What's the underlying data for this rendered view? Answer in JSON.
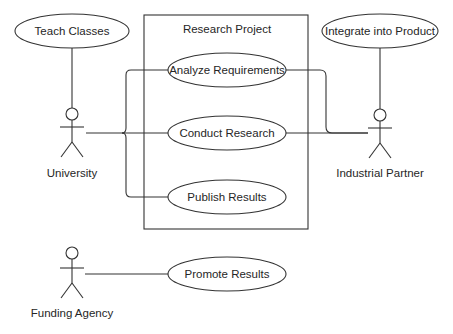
{
  "diagram": {
    "type": "uml-use-case",
    "system": {
      "title": "Research Project"
    },
    "actors": [
      {
        "id": "university",
        "label": "University"
      },
      {
        "id": "industrial_partner",
        "label": "Industrial Partner"
      },
      {
        "id": "funding_agency",
        "label": "Funding Agency"
      }
    ],
    "use_cases": {
      "teach_classes": "Teach Classes",
      "integrate_into_product": "Integrate into Product",
      "analyze_requirements": "Analyze Requirements",
      "conduct_research": "Conduct Research",
      "publish_results": "Publish Results",
      "promote_results": "Promote Results"
    },
    "associations": [
      {
        "actor": "University",
        "use_case": "Teach Classes"
      },
      {
        "actor": "University",
        "use_case": "Analyze Requirements"
      },
      {
        "actor": "University",
        "use_case": "Conduct Research"
      },
      {
        "actor": "University",
        "use_case": "Publish Results"
      },
      {
        "actor": "Industrial Partner",
        "use_case": "Integrate into Product"
      },
      {
        "actor": "Industrial Partner",
        "use_case": "Analyze Requirements"
      },
      {
        "actor": "Industrial Partner",
        "use_case": "Conduct Research"
      },
      {
        "actor": "Funding Agency",
        "use_case": "Promote Results"
      }
    ],
    "colors": {
      "line": "#333333",
      "text": "#262626",
      "background": "#ffffff"
    }
  }
}
